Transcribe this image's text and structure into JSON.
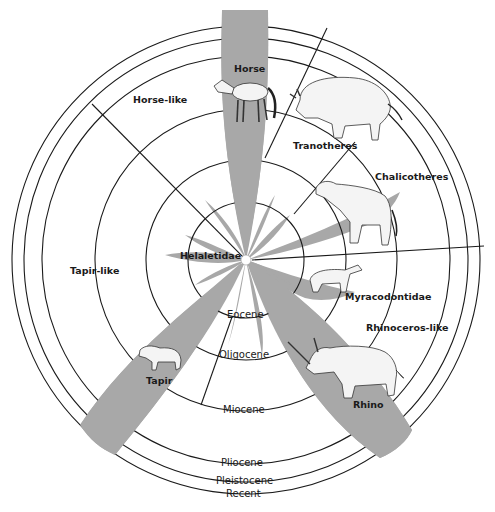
{
  "colors": {
    "ray_fill": "#a8a8a8",
    "line": "#1a1a1a",
    "background": "#ffffff"
  },
  "center": {
    "label": "Helaletidae"
  },
  "eras": [
    {
      "name": "Eocene",
      "radius": 58
    },
    {
      "name": "Oligocene",
      "radius": 100
    },
    {
      "name": "Miocene",
      "radius": 151
    },
    {
      "name": "Pliocene",
      "radius": 204
    },
    {
      "name": "Pleistocene",
      "radius": 222
    },
    {
      "name": "Recent",
      "radius": 234
    }
  ],
  "groups": [
    {
      "name": "Horse-like",
      "members": [
        "Horse"
      ]
    },
    {
      "name": "Tapir-like",
      "members": [
        "Tapir",
        "Helaletidae"
      ]
    },
    {
      "name": "Rhinoceros-like",
      "members": [
        "Rhino",
        "Myracodontidae"
      ]
    },
    {
      "name": "Tranotheres",
      "members": []
    },
    {
      "name": "Chalicotheres",
      "members": []
    }
  ],
  "labels": {
    "horse": "Horse",
    "horse_like": "Horse-like",
    "tranotheres": "Tranotheres",
    "chalicotheres": "Chalicotheres",
    "helaletidae": "Helaletidae",
    "tapir_like": "Tapir-like",
    "myracodontidae": "Myracodontidae",
    "rhinoceros_like": "Rhinoceros-like",
    "tapir": "Tapir",
    "rhino": "Rhino",
    "eocene": "Eocene",
    "oligocene": "Oligocene",
    "miocene": "Miocene",
    "pliocene": "Pliocene",
    "pleistocene": "Pleistocene",
    "recent": "Recent"
  },
  "illustrations": [
    "horse",
    "titanothere",
    "chalicothere",
    "hyracodont",
    "tapir",
    "rhinoceros"
  ]
}
